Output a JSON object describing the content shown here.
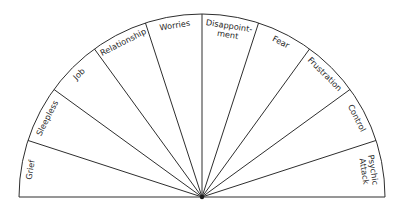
{
  "diagram": {
    "type": "semicircle-pendulum-chart",
    "center": {
      "x": 202,
      "y": 197
    },
    "radius": 183,
    "line_color": "#2e2e2e",
    "text_color": "#2a2a2a",
    "background": "#ffffff",
    "sectors": [
      {
        "label": "Grief",
        "lines": [
          "Grief"
        ]
      },
      {
        "label": "Sleepless",
        "lines": [
          "Sleepless"
        ]
      },
      {
        "label": "Job",
        "lines": [
          "Job"
        ]
      },
      {
        "label": "Relationship",
        "lines": [
          "Relationship"
        ]
      },
      {
        "label": "Worries",
        "lines": [
          "Worries"
        ]
      },
      {
        "label": "Disappointment",
        "lines": [
          "Disappoint-",
          "ment"
        ]
      },
      {
        "label": "Fear",
        "lines": [
          "Fear"
        ]
      },
      {
        "label": "Frustration",
        "lines": [
          "Frustration"
        ]
      },
      {
        "label": "Control",
        "lines": [
          "Control"
        ]
      },
      {
        "label": "Psychic Attack",
        "lines": [
          "Psychic",
          "Attack"
        ]
      }
    ]
  }
}
